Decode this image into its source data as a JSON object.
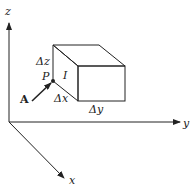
{
  "diagram": {
    "axes": {
      "z_label": "z",
      "y_label": "y",
      "x_label": "x"
    },
    "labels": {
      "delta_z": "Δz",
      "delta_x": "Δx",
      "delta_y": "Δy",
      "point": "P",
      "face": "I",
      "vector": "A"
    },
    "colors": {
      "stroke": "#222222",
      "background": "#ffffff"
    }
  }
}
